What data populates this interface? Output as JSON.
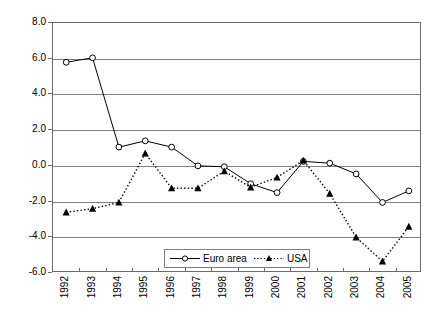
{
  "chart_data": {
    "type": "line",
    "title": "",
    "xlabel": "",
    "ylabel": "",
    "grid": true,
    "legend_position": "bottom-center",
    "categories": [
      "1992",
      "1993",
      "1994",
      "1995",
      "1996",
      "1997",
      "1998",
      "1999",
      "2000",
      "2001",
      "2002",
      "2003",
      "2004",
      "2005"
    ],
    "ylim": [
      -6.0,
      8.0
    ],
    "ytick_labels": [
      "8.0",
      "6.0",
      "4.0",
      "2.0",
      "0.0",
      "-2.0",
      "-4.0",
      "-6.0"
    ],
    "ytick_values": [
      8.0,
      6.0,
      4.0,
      2.0,
      0.0,
      -2.0,
      -4.0,
      -6.0
    ],
    "series": [
      {
        "name": "Euro area",
        "marker": "open-circle",
        "line_style": "solid",
        "color": "#000000",
        "values": [
          5.8,
          6.05,
          1.05,
          1.4,
          1.05,
          0.0,
          -0.05,
          -1.0,
          -1.5,
          0.25,
          0.15,
          -0.45,
          -2.05,
          -1.4
        ]
      },
      {
        "name": "USA",
        "marker": "filled-triangle",
        "line_style": "dotted",
        "color": "#000000",
        "values": [
          -2.6,
          -2.4,
          -2.05,
          0.7,
          -1.25,
          -1.25,
          -0.3,
          -1.2,
          -0.65,
          0.3,
          -1.55,
          -4.0,
          -5.35,
          -3.4
        ]
      }
    ]
  },
  "legend": {
    "entries": [
      {
        "label": "Euro area"
      },
      {
        "label": "USA"
      }
    ]
  }
}
